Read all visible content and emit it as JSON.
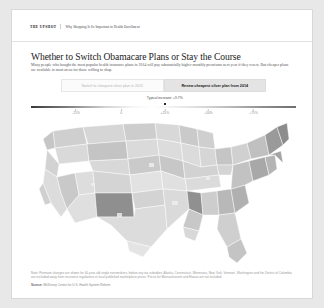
{
  "header": {
    "brand": "The Upshot",
    "breadcrumb": "Why Shopping Is So Important in Health Enrollment"
  },
  "article": {
    "headline": "Whether to Switch Obamacare Plans or Stay the Course",
    "subhead": "Many people who bought the most popular health insurance plans in 2014 will pay substantially higher monthly premiums next year if they renew. But cheaper plans are available in most areas for those willing to shop."
  },
  "toggle": {
    "options": [
      {
        "label": "Switch to cheapest silver plan in 2015",
        "active": false
      },
      {
        "label": "Renew cheapest silver plan from 2014",
        "active": true
      }
    ]
  },
  "legend": {
    "annotation": "Typical increase: +9.7%",
    "marker_percent": 50.5,
    "ticks": [
      {
        "label": "-25%",
        "percent": 17
      },
      {
        "label": "0",
        "percent": 34
      },
      {
        "label": "+25%",
        "percent": 50.5
      },
      {
        "label": "+50%",
        "percent": 67
      },
      {
        "label": "+75%",
        "percent": 84
      }
    ],
    "colors": {
      "low": "#3a3a3a",
      "mid": "#ffffff",
      "high": "#6e6e6e"
    }
  },
  "map": {
    "type": "choropleth",
    "region": "United States",
    "unit": "county"
  },
  "footnotes": {
    "note": "Note: Premium changes are shown for 40-year-old single nonsmokers, before any tax subsidies. Alaska, Connecticut, Minnesota, New York, Vermont, Washington and the District of Columbia are excluded away from insurance regulations or local published marketplace prices. Prices for Massachusetts and Hawaii are not included.",
    "source_label": "Source:",
    "source_value": "McKinsey Center for U.S. Health System Reform"
  }
}
